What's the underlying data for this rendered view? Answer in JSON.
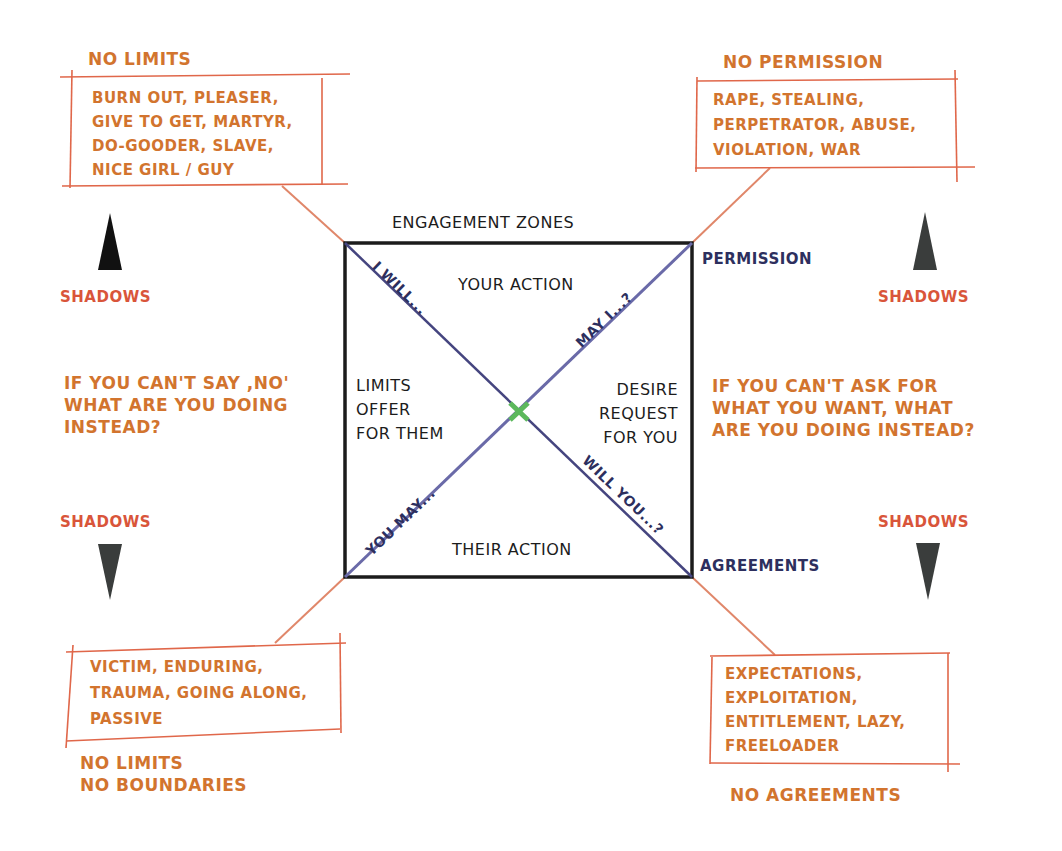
{
  "diagram": {
    "title": "ENGAGEMENT ZONES",
    "quadrants": {
      "top": "YOUR ACTION",
      "bottom": "THEIR ACTION",
      "left": [
        "LIMITS",
        "OFFER",
        "FOR THEM"
      ],
      "right": [
        "DESIRE",
        "REQUEST",
        "FOR YOU"
      ]
    },
    "diagonal_labels": {
      "top_left": "I WILL...",
      "top_right": "MAY I...?",
      "bottom_left": "YOU MAY...",
      "bottom_right": "WILL YOU...?"
    },
    "corner_labels": {
      "top_right": "PERMISSION",
      "bottom_right": "AGREEMENTS"
    },
    "shadows_label": "SHADOWS",
    "top_left_group": {
      "heading": "NO LIMITS",
      "lines": [
        "BURN OUT, PLEASER,",
        "GIVE TO GET, MARTYR,",
        "DO-GOODER, SLAVE,",
        "NICE GIRL / GUY"
      ]
    },
    "top_right_group": {
      "heading": "NO PERMISSION",
      "lines": [
        "RAPE, STEALING,",
        "PERPETRATOR, ABUSE,",
        "VIOLATION, WAR"
      ]
    },
    "bottom_left_group": {
      "lines": [
        "VICTIM, ENDURING,",
        "TRAUMA, GOING ALONG,",
        "PASSIVE"
      ],
      "footer": [
        "NO LIMITS",
        "NO BOUNDARIES"
      ]
    },
    "bottom_right_group": {
      "lines": [
        "EXPECTATIONS,",
        "EXPLOITATION,",
        "ENTITLEMENT, LAZY,",
        "FREELOADER"
      ],
      "footer": "NO AGREEMENTS"
    },
    "left_question": [
      "IF YOU CAN'T SAY ,NO'",
      "WHAT ARE YOU DOING",
      "INSTEAD?"
    ],
    "right_question": [
      "IF YOU CAN'T ASK FOR",
      "WHAT YOU WANT, WHAT",
      "ARE YOU DOING INSTEAD?"
    ],
    "colors": {
      "orange_text": "#d2742e",
      "shadow_red": "#d9553a",
      "navy": "#2d2f5e",
      "box_line": "#e0674a",
      "diagonal": "#4a4a8a",
      "center_mark": "#5cb85c",
      "square": "#1c1c1c"
    }
  }
}
